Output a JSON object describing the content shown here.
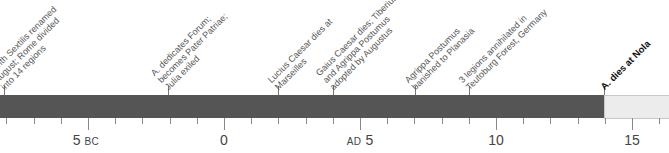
{
  "timeline": {
    "colors": {
      "period_fill": "#555555",
      "future_fill": "#ececec",
      "future_border": "#c8c8c8",
      "tick": "#888888"
    },
    "axis": {
      "labels": [
        {
          "x": 86,
          "value": "5",
          "era": "BC",
          "era_position": "after"
        },
        {
          "x": 224,
          "value": "0",
          "era": "",
          "era_position": ""
        },
        {
          "x": 360,
          "value": "5",
          "era": "AD",
          "era_position": "before"
        },
        {
          "x": 496,
          "value": "10",
          "era": "",
          "era_position": ""
        },
        {
          "x": 632,
          "value": "15",
          "era": "",
          "era_position": ""
        }
      ]
    },
    "events": [
      {
        "x": 4,
        "year": "8 BC",
        "text": "Month Sextilis renamed\nAugust; Rome divided\ninto 14 regions",
        "bold": false
      },
      {
        "x": 168,
        "year": "2 BC",
        "text": "A. dedicates Forum;\nbecomes Pater Patriae;\nJulia exiled",
        "bold": false
      },
      {
        "x": 278,
        "year": "AD 2",
        "text": "Lucius Caesar dies at\nMarseilles",
        "bold": false
      },
      {
        "x": 333,
        "year": "AD 4",
        "text": "Gaius Caesar dies; Tiberius\nand Agrippa Postumus\nadopted by Augustus",
        "bold": false
      },
      {
        "x": 415,
        "year": "AD 7",
        "text": "Agrippa Postumus\nbanished to Planasia",
        "bold": false
      },
      {
        "x": 469,
        "year": "AD 9",
        "text": "3 legions annihilated in\nTeutoburg Forest, Germany",
        "bold": false
      },
      {
        "x": 604,
        "year": "AD 14",
        "text": "A. dies at Nola",
        "bold": true
      }
    ]
  }
}
